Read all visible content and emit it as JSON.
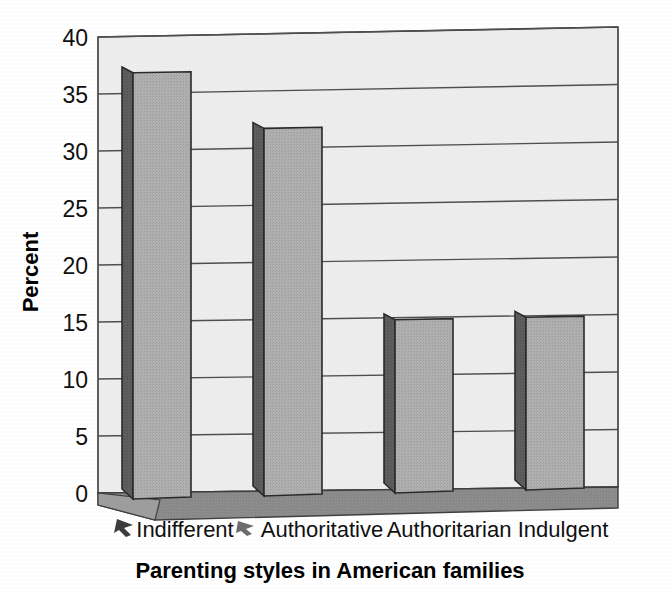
{
  "chart_data": {
    "type": "bar",
    "title": "",
    "xlabel": "Parenting styles in American families",
    "ylabel": "Percent",
    "categories": [
      "Indifferent",
      "Authoritative",
      "Authoritarian",
      "Indulgent"
    ],
    "values": [
      36.8,
      31.7,
      14.7,
      14.7
    ],
    "ylim": [
      0,
      40
    ],
    "yticks": [
      0,
      5,
      10,
      15,
      20,
      25,
      30,
      35,
      40
    ],
    "ytick_labels": [
      "0",
      "5",
      "10",
      "15",
      "20",
      "25",
      "30",
      "35",
      "40"
    ],
    "grid": true,
    "legend": false,
    "style": "3d-bar",
    "colors": {
      "bar_front": "#a8a8a8",
      "bar_side": "#5e5e5e",
      "plot_background": "#ececec",
      "floor": "#8f8f8f",
      "floor_front": "#9a9a9a",
      "gridline": "#4a4a4a",
      "text": "#101010"
    }
  },
  "axis": {
    "y_title": "Percent",
    "x_title": "Parenting styles in American families"
  },
  "ticks": {
    "y": [
      "40",
      "35",
      "30",
      "25",
      "20",
      "15",
      "10",
      "5",
      "0"
    ]
  },
  "categories": {
    "c0": "Indifferent",
    "c1": "Authoritative",
    "c2": "Authoritarian",
    "c3": "Indulgent"
  }
}
